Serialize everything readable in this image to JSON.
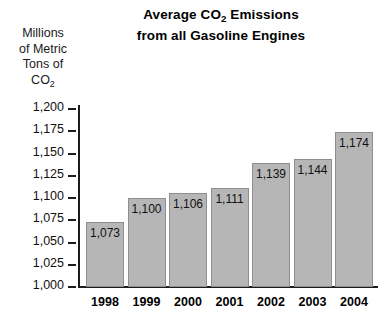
{
  "chart_data": {
    "type": "bar",
    "title": "Average CO2 Emissions from all Gasoline Engines",
    "title_lines": [
      "Average CO2 Emissions",
      "from all Gasoline Engines"
    ],
    "xlabel": "",
    "ylabel": "Millions of Metric Tons of CO2",
    "ylabel_lines": [
      "Millions",
      "of Metric",
      "Tons of",
      "CO2"
    ],
    "categories": [
      "1998",
      "1999",
      "2000",
      "2001",
      "2002",
      "2003",
      "2004"
    ],
    "values": [
      1073,
      1100,
      1106,
      1111,
      1139,
      1144,
      1174
    ],
    "value_labels": [
      "1,073",
      "1,100",
      "1,106",
      "1,111",
      "1,139",
      "1,144",
      "1,174"
    ],
    "ylim": [
      1000,
      1200
    ],
    "ytick_values": [
      1200,
      1175,
      1150,
      1125,
      1100,
      1075,
      1050,
      1025,
      1000
    ],
    "ytick_labels": [
      "1,200",
      "1,175",
      "1,150",
      "1,125",
      "1,100",
      "1,075",
      "1,050",
      "1,025",
      "1,000"
    ],
    "grid": false,
    "legend": "none",
    "bar_color": "#b6b6b6",
    "bar_border_color": "#8e8e8e",
    "axis_color": "#1c1c1c",
    "background_color": "#ffffff",
    "text_color": "#111111"
  }
}
